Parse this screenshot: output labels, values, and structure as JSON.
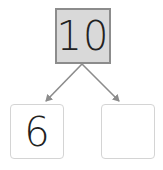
{
  "diagram": {
    "type": "number-bond",
    "whole": "10",
    "parts": [
      {
        "value": "6"
      },
      {
        "value": ""
      }
    ],
    "colors": {
      "whole_fill": "#d9d9d9",
      "whole_border": "#8c8c8c",
      "part_border": "#d4d4d4",
      "arrow": "#8c8c8c"
    }
  }
}
